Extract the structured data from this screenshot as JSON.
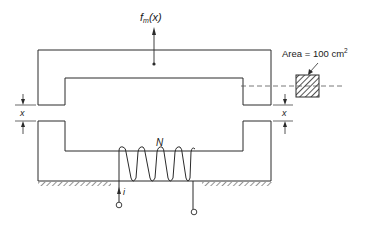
{
  "figure": {
    "type": "electromagnet-force-diagram",
    "labels": {
      "force": "f",
      "force_sub": "m",
      "force_arg": "(x)",
      "area_text": "Area  =  100 cm",
      "area_sup": "2",
      "gap_left": "x",
      "gap_right": "x",
      "turns": "N",
      "current": "i"
    },
    "components": {
      "upper_core": "movable U-shaped plunger",
      "lower_core": "fixed U-shaped core",
      "coil_turns_drawn": 5,
      "cross_section": "hatched square, 100 cm^2"
    },
    "colors": {
      "stroke": "#2a2a2a",
      "background": "#ffffff"
    }
  }
}
